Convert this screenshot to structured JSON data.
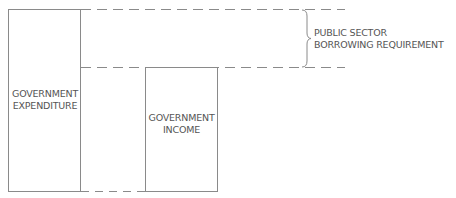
{
  "diagram": {
    "labels": {
      "expenditure_line1": "GOVERNMENT",
      "expenditure_line2": "EXPENDITURE",
      "income_line1": "GOVERNMENT",
      "income_line2": "INCOME",
      "psbr_line1": "PUBLIC SECTOR",
      "psbr_line2": "BORROWING REQUIREMENT"
    },
    "colors": {
      "line": "#8a8a8a",
      "text": "#555555"
    }
  }
}
